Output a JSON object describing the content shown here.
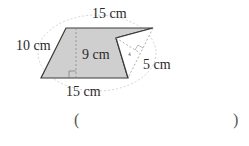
{
  "diagram": {
    "shape": "trapezoid-with-notch",
    "labels": {
      "top": "15 cm",
      "left": "10 cm",
      "height": "9 cm",
      "notch": "5 cm",
      "bottom": "15 cm"
    },
    "colors": {
      "fill": "#cfcfcf",
      "stroke": "#3a3a3a",
      "dashed": "#b0b0b0"
    }
  },
  "answer": {
    "open_paren": "(",
    "close_paren": ")",
    "value": ""
  }
}
